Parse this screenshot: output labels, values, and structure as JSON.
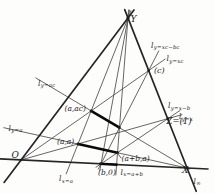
{
  "figure": {
    "width": 214,
    "height": 194,
    "colors": {
      "background": "#fdfdfc",
      "thin_line": "#4a4a4a",
      "side_line": "#262626",
      "highlight_line": "#0a0a0a",
      "ink": "#222222"
    },
    "segments": [
      {
        "name": "line-x-eq-a",
        "kind": "thin",
        "x1": 131.0,
        "y1": 10.6,
        "x2": 66.2,
        "y2": 173.8
      },
      {
        "name": "line-x-eq-b",
        "kind": "thin",
        "x1": 129.5,
        "y1": 10.1,
        "x2": 99.8,
        "y2": 170.4
      },
      {
        "name": "line-x-eq-a-plus-b",
        "kind": "thin",
        "x1": 128.6,
        "y1": 10.0,
        "x2": 115.8,
        "y2": 175.0
      },
      {
        "name": "line-y-eq-a",
        "kind": "thin",
        "x1": 3.8,
        "y1": 127.7,
        "x2": 190.0,
        "y2": 168.7
      },
      {
        "name": "line-y-eq-ac",
        "kind": "thin",
        "x1": 35.8,
        "y1": 77.9,
        "x2": 189.0,
        "y2": 169.2
      },
      {
        "name": "line-y-eq-x",
        "kind": "thin",
        "x1": 21.0,
        "y1": 160.0,
        "x2": 182.0,
        "y2": 114.7
      },
      {
        "name": "line-y-eq-x-minus-b",
        "kind": "thin",
        "x1": 96.0,
        "y1": 167.2,
        "x2": 180.1,
        "y2": 110.4
      },
      {
        "name": "line-y-eq-xc",
        "kind": "thin",
        "x1": 21.0,
        "y1": 160.0,
        "x2": 165.1,
        "y2": 59.1
      },
      {
        "name": "line-y-eq-xc-minus-bc",
        "kind": "thin",
        "x1": 98.3,
        "y1": 169.1,
        "x2": 158.7,
        "y2": 51.0
      },
      {
        "name": "leader-a-plus-b-a",
        "kind": "thin",
        "x1": 121.0,
        "y1": 158.0,
        "x2": 118.2,
        "y2": 154.0
      },
      {
        "name": "line-O-Y-axis",
        "kind": "side",
        "x1": 4.1,
        "y1": 182.4,
        "x2": 134.0,
        "y2": 10.0
      },
      {
        "name": "line-x-axis",
        "kind": "side",
        "x1": 0.0,
        "y1": 158.9,
        "x2": 208.0,
        "y2": 169.0
      },
      {
        "name": "line-at-infinity",
        "kind": "side",
        "x1": 124.7,
        "y1": 9.6,
        "x2": 196.2,
        "y2": 191.3
      },
      {
        "name": "highlight-seg-y-ac",
        "kind": "hi",
        "x1": 91.1,
        "y1": 110.9,
        "x2": 119.5,
        "y2": 127.7
      },
      {
        "name": "highlight-seg-y-a",
        "kind": "hi",
        "x1": 78.0,
        "y1": 144.0,
        "x2": 117.5,
        "y2": 152.7
      },
      {
        "name": "highlight-seg-x-axis",
        "kind": "hi",
        "x1": 99.5,
        "y1": 163.7,
        "x2": 117.5,
        "y2": 164.7
      }
    ],
    "points": [
      {
        "name": "point-Y",
        "x": 128.0,
        "y": 18.0,
        "r": 1.6
      },
      {
        "name": "point-O",
        "x": 21.0,
        "y": 160.0,
        "r": 1.3
      },
      {
        "name": "point-X",
        "x": 187.0,
        "y": 168.0,
        "r": 1.5
      },
      {
        "name": "point-Z-unit",
        "x": 167.7,
        "y": 118.8,
        "r": 1.4
      },
      {
        "name": "point-c",
        "x": 148.7,
        "y": 70.6,
        "r": 1.3
      },
      {
        "name": "point-a-ac",
        "x": 91.1,
        "y": 110.9,
        "r": 1.4
      },
      {
        "name": "point-a-a",
        "x": 78.0,
        "y": 144.0,
        "r": 1.4
      },
      {
        "name": "point-b-0",
        "x": 101.0,
        "y": 163.8,
        "r": 1.3
      },
      {
        "name": "point-a-plus-b-a",
        "x": 117.5,
        "y": 152.7,
        "r": 1.4
      },
      {
        "name": "point-a-plus-b-ac",
        "x": 119.5,
        "y": 127.7,
        "r": 1.3
      }
    ],
    "labels": [
      {
        "name": "label-Y",
        "text": "Y",
        "x": 130.5,
        "y": 22.0,
        "size": 9
      },
      {
        "name": "label-O",
        "text": "O",
        "x": 11.5,
        "y": 157.5,
        "size": 9
      },
      {
        "name": "label-X",
        "text": "X",
        "x": 182.0,
        "y": 172.5,
        "size": 9
      },
      {
        "name": "label-Z-unit",
        "text": "Z=(1)",
        "x": 166.5,
        "y": 124.0,
        "size": 8.5
      },
      {
        "name": "label-c",
        "text": "(c)",
        "x": 154.0,
        "y": 73.0,
        "size": 8
      },
      {
        "name": "label-a-ac",
        "text": "(a,ac)",
        "x": 64.5,
        "y": 111.0,
        "size": 7.5
      },
      {
        "name": "label-a-a",
        "text": "(a,a)",
        "x": 57.0,
        "y": 143.5,
        "size": 7.5
      },
      {
        "name": "label-a-plus-b-a",
        "text": "(a+b,a)",
        "x": 121.5,
        "y": 160.5,
        "size": 7.5
      },
      {
        "name": "label-b-0",
        "text": "(b,0)",
        "x": 98.0,
        "y": 174.5,
        "size": 7.5
      },
      {
        "name": "label-line-y-ac",
        "main": "l",
        "sub": "y=ac",
        "x": 38.0,
        "y": 85.5
      },
      {
        "name": "label-line-y-a",
        "main": "l",
        "sub": "y=a",
        "x": 8.5,
        "y": 130.5
      },
      {
        "name": "label-line-y-xc-bc",
        "main": "l",
        "sub": "y=xc−bc",
        "x": 151.0,
        "y": 47.5
      },
      {
        "name": "label-line-y-xc",
        "main": "l",
        "sub": "y=xc",
        "x": 166.5,
        "y": 61.0
      },
      {
        "name": "label-line-y-x-b",
        "main": "l",
        "sub": "y=x−b",
        "x": 168.0,
        "y": 108.0
      },
      {
        "name": "label-line-y-x",
        "main": "l",
        "sub": "y=x",
        "x": 179.0,
        "y": 119.0
      },
      {
        "name": "label-line-x-a",
        "main": "l",
        "sub": "x=a",
        "x": 59.0,
        "y": 181.0
      },
      {
        "name": "label-line-x-a-plus-b",
        "main": "l",
        "sub": "x=a+b",
        "x": 120.5,
        "y": 174.5
      },
      {
        "name": "label-line-infinity",
        "main": "l",
        "sub": "∞",
        "x": 193.5,
        "y": 183.5
      }
    ],
    "label_font": {
      "main_size": 7.5,
      "sub_size": 5.4,
      "sub_dy": 1.8,
      "sub_dx": 0.4
    }
  }
}
